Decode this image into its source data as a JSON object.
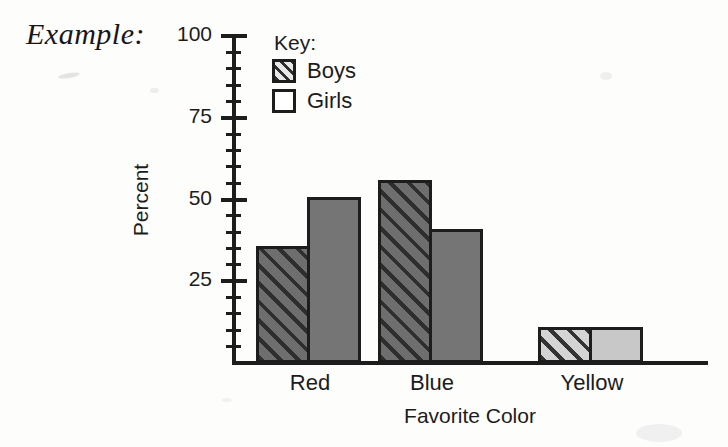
{
  "caption": "Example:",
  "legend": {
    "title": "Key:",
    "entries": [
      {
        "label": "Boys",
        "swatch": "hatched-swatch"
      },
      {
        "label": "Girls",
        "swatch": "empty-swatch"
      }
    ]
  },
  "colors": {
    "axis": "#1d1d1d",
    "boys_fill_dark": "#6e6e6e",
    "boys_hatch_dark": "#2e2e2e",
    "girls_fill_dark": "#757575",
    "boys_fill_light": "#d4d4d4",
    "boys_hatch_light": "#333333",
    "girls_fill_light": "#c8c8c8",
    "page_background": "#fdfdfc"
  },
  "chart_data": {
    "type": "bar",
    "title": "",
    "xlabel": "Favorite Color",
    "ylabel": "Percent",
    "categories": [
      "Red",
      "Blue",
      "Yellow"
    ],
    "series": [
      {
        "name": "Boys",
        "values": [
          35,
          55,
          10
        ]
      },
      {
        "name": "Girls",
        "values": [
          50,
          40,
          10
        ]
      }
    ],
    "ylim": [
      0,
      100
    ],
    "ytick_labels": [
      "100",
      "75",
      "50",
      "25"
    ],
    "ytick_values": [
      100,
      75,
      50,
      25
    ],
    "minor_tick_step": 5,
    "grid": false,
    "legend_position": "top-left-inside"
  }
}
